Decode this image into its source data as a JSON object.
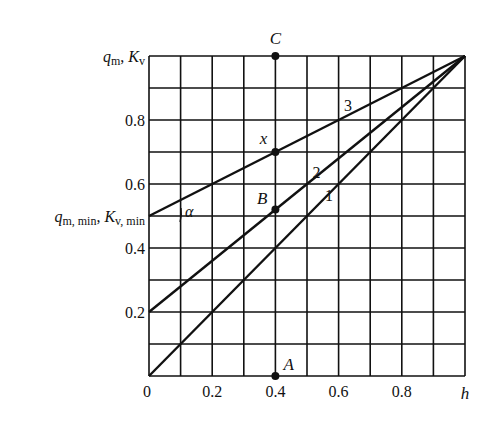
{
  "chart_data": {
    "type": "line",
    "title": "",
    "xlabel": "h",
    "ylabel": "q_m, K_v",
    "xlim": [
      0,
      1
    ],
    "ylim": [
      0,
      1
    ],
    "grid": true,
    "x_ticks": [
      "0",
      "0.2",
      "0.4",
      "0.6",
      "0.8"
    ],
    "y_ticks": [
      "0.2",
      "0.4",
      "0.6",
      "0.8"
    ],
    "y_top_label": {
      "main": "q",
      "sub": "m",
      "sep": ", ",
      "main2": "K",
      "sub2": "v"
    },
    "y_min_label": {
      "main": "q",
      "sub": "m, min",
      "sep": ", ",
      "main2": "K",
      "sub2": "v, min"
    },
    "series": [
      {
        "name": "1",
        "x": [
          0,
          1
        ],
        "y": [
          0,
          1
        ]
      },
      {
        "name": "2",
        "x": [
          0,
          1
        ],
        "y": [
          0.2,
          1
        ]
      },
      {
        "name": "3",
        "x": [
          0,
          1
        ],
        "y": [
          0.5,
          1
        ]
      }
    ],
    "points": [
      {
        "label": "A",
        "x": 0.4,
        "y": 0.0
      },
      {
        "label": "B",
        "x": 0.4,
        "y": 0.52
      },
      {
        "label": "x",
        "x": 0.4,
        "y": 0.7
      },
      {
        "label": "C",
        "x": 0.4,
        "y": 1.0
      }
    ],
    "annotations": {
      "angle": "α"
    },
    "vertical_line_at": 0.4
  }
}
